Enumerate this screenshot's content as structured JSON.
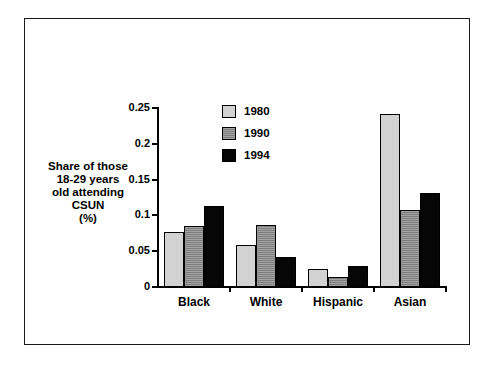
{
  "chart_data": {
    "type": "bar",
    "title": "",
    "xlabel": "",
    "ylabel": "Share of those\n18-29 years\nold attending\nCSUN\n(%)",
    "categories": [
      "Black",
      "White",
      "Hispanic",
      "Asian"
    ],
    "series": [
      {
        "name": "1980",
        "color": "#d2d2d2",
        "values": [
          0.077,
          0.059,
          0.025,
          0.241
        ]
      },
      {
        "name": "1990",
        "color": "#8c8c8c",
        "values": [
          0.085,
          0.086,
          0.014,
          0.107
        ]
      },
      {
        "name": "1994",
        "color": "#060606",
        "values": [
          0.113,
          0.042,
          0.029,
          0.131
        ]
      }
    ],
    "ylim": [
      0,
      0.25
    ],
    "ytick_labels": [
      "0",
      "0.05",
      "0.1",
      "0.15",
      "0.2",
      "0.25"
    ],
    "ytick_values": [
      0,
      0.05,
      0.1,
      0.15,
      0.2,
      0.25
    ],
    "grid": false,
    "legend_position": "top-center"
  },
  "legend": {
    "entries": [
      {
        "label": "1980"
      },
      {
        "label": "1990"
      },
      {
        "label": "1994"
      }
    ]
  }
}
